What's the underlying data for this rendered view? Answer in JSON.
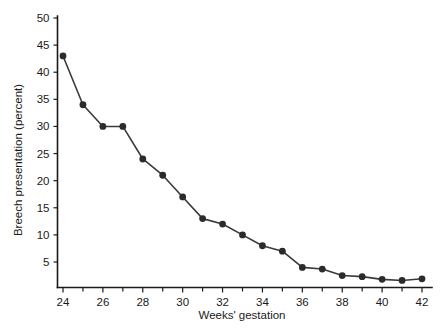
{
  "chart_data": {
    "type": "line",
    "title": "",
    "subtitle": "",
    "xlabel": "Weeks' gestation",
    "ylabel": "Breech presentation (percent)",
    "x": [
      24,
      25,
      26,
      27,
      28,
      29,
      30,
      31,
      32,
      33,
      34,
      35,
      36,
      37,
      38,
      39,
      40,
      41,
      42
    ],
    "values": [
      43,
      34,
      30,
      30,
      24,
      21,
      17,
      13,
      12,
      10,
      8,
      7,
      4,
      3.7,
      2.5,
      2.3,
      1.8,
      1.6,
      1.9
    ],
    "series": [
      {
        "name": "Breech presentation",
        "values": [
          43,
          34,
          30,
          30,
          24,
          21,
          17,
          13,
          12,
          10,
          8,
          7,
          4,
          3.7,
          2.5,
          2.3,
          1.8,
          1.6,
          1.9
        ]
      }
    ],
    "xlim": [
      23,
      42.6
    ],
    "ylim": [
      0,
      50
    ],
    "xticks": [
      24,
      26,
      28,
      30,
      32,
      34,
      36,
      38,
      40,
      42
    ],
    "xticklabels": [
      "24",
      "26",
      "28",
      "30",
      "32",
      "34",
      "36",
      "38",
      "40",
      "42"
    ],
    "xminorticks": [
      25,
      27,
      29,
      31,
      33,
      35,
      37,
      39,
      41
    ],
    "yticks": [
      5,
      10,
      15,
      20,
      25,
      30,
      35,
      40,
      45,
      50
    ],
    "yticklabels": [
      "5",
      "10",
      "15",
      "20",
      "25",
      "30",
      "35",
      "40",
      "45",
      "50"
    ],
    "grid": false,
    "legend": false,
    "legend_position": "none",
    "marker": "filled-circle",
    "line_color": "#3a3a3a",
    "marker_color": "#2b2b2b",
    "background_color": "#ffffff"
  }
}
